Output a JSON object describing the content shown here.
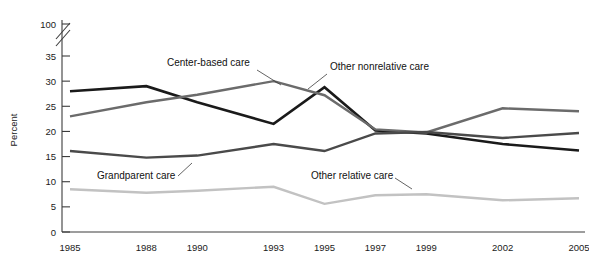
{
  "chart_data": {
    "type": "line",
    "title": "",
    "xlabel": "",
    "ylabel": "Percent",
    "x": [
      1985,
      1988,
      1990,
      1993,
      1995,
      1997,
      1999,
      2002,
      2005
    ],
    "xtick_labels": [
      "1985",
      "1988",
      "1990",
      "1993",
      "1995",
      "1997",
      "1999",
      "2002",
      "2005"
    ],
    "ytick_labels": [
      "0",
      "5",
      "10",
      "15",
      "20",
      "25",
      "30",
      "35",
      "100"
    ],
    "ytick_values": [
      0,
      5,
      10,
      15,
      20,
      25,
      30,
      35,
      100
    ],
    "ylim": [
      0,
      35
    ],
    "axis_break": true,
    "axis_break_note": "y-axis broken between 35 and 100",
    "grid": false,
    "legend_position": "inline-annotations",
    "series": [
      {
        "name": "Other nonrelative care",
        "color": "#1a1a1a",
        "width": 2.6,
        "values": [
          28.0,
          29.0,
          25.8,
          21.5,
          28.8,
          20.2,
          19.6,
          17.5,
          16.2
        ]
      },
      {
        "name": "Center-based care",
        "color": "#6b6b6b",
        "width": 2.4,
        "values": [
          23.0,
          25.8,
          27.3,
          30.0,
          27.2,
          20.4,
          19.8,
          24.6,
          24.0
        ]
      },
      {
        "name": "Grandparent care",
        "color": "#4a4a4a",
        "width": 2.4,
        "values": [
          16.1,
          14.8,
          15.2,
          17.5,
          16.1,
          19.6,
          19.9,
          18.7,
          19.7
        ]
      },
      {
        "name": "Other relative care",
        "color": "#c2c2c2",
        "width": 2.4,
        "values": [
          8.5,
          7.8,
          8.2,
          9.0,
          5.6,
          7.3,
          7.5,
          6.3,
          6.7
        ]
      }
    ],
    "annotations": [
      {
        "label": "Center-based care",
        "text_x": 167,
        "text_y": 66,
        "leader": "M 257 70 L 281 85"
      },
      {
        "label": "Other nonrelative care",
        "text_x": 330,
        "text_y": 70,
        "leader": "M 327 74 L 308 89"
      },
      {
        "label": "Grandparent care",
        "text_x": 97,
        "text_y": 179,
        "leader": "M 178 176 L 192 163"
      },
      {
        "label": "Other relative care",
        "text_x": 311,
        "text_y": 179,
        "leader": "M 395 178 L 412 189"
      }
    ]
  }
}
